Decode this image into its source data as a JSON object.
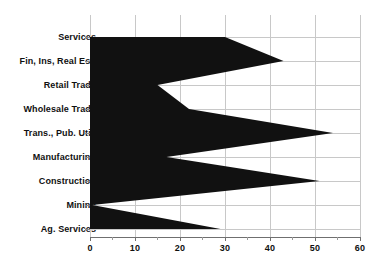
{
  "chart_data": {
    "type": "area",
    "orientation": "horizontal",
    "title": "",
    "subtitle": "",
    "xlabel": "",
    "ylabel": "",
    "xlim": [
      0,
      60
    ],
    "ylim_categories": 9,
    "grid": true,
    "legend": null,
    "legend_position": "none",
    "fill_color": "#111111",
    "grid_color": "#c8c8c8",
    "background_color": "#ffffff",
    "axis_color": "#6f6f6f",
    "categories": [
      "Services",
      "Fin, Ins, Real Est.",
      "Retail Trade",
      "Wholesale Trade",
      "Trans., Pub. Util.",
      "Manufacturing",
      "Construction",
      "Mining",
      "Ag. Services"
    ],
    "values": [
      30,
      43,
      15,
      22,
      54,
      17,
      51,
      0.5,
      29
    ],
    "xticks": [
      0,
      10,
      20,
      30,
      40,
      50,
      60
    ],
    "xticklabels": [
      "0",
      "10",
      "20",
      "30",
      "40",
      "50",
      "60"
    ],
    "xminorticks": [
      5,
      15,
      25,
      35,
      45,
      55
    ]
  }
}
